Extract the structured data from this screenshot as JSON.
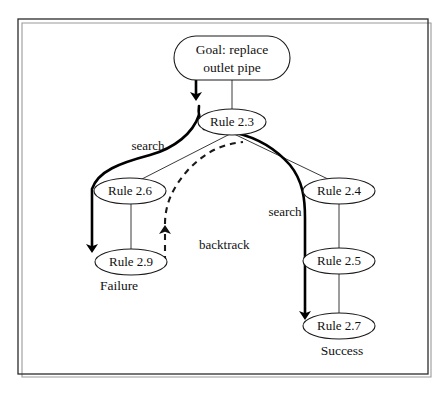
{
  "diagram": {
    "frame": {
      "x": 18,
      "y": 19,
      "width": 410,
      "height": 355
    },
    "nodes": [
      {
        "id": "goal",
        "shape": "stadium",
        "label_line1": "Goal: replace",
        "label_line2": "outlet pipe",
        "cx": 232,
        "cy": 58,
        "rx": 58,
        "ry": 22
      },
      {
        "id": "rule23",
        "shape": "ellipse",
        "label": "Rule 2.3",
        "cx": 232,
        "cy": 122,
        "rx": 34,
        "ry": 13
      },
      {
        "id": "rule26",
        "shape": "ellipse",
        "label": "Rule 2.6",
        "cx": 130,
        "cy": 191,
        "rx": 36,
        "ry": 13
      },
      {
        "id": "rule29",
        "shape": "ellipse",
        "label": "Rule 2.9",
        "cx": 131,
        "cy": 262,
        "rx": 36,
        "ry": 13
      },
      {
        "id": "rule24",
        "shape": "ellipse",
        "label": "Rule 2.4",
        "cx": 339,
        "cy": 191,
        "rx": 36,
        "ry": 13
      },
      {
        "id": "rule25",
        "shape": "ellipse",
        "label": "Rule 2.5",
        "cx": 339,
        "cy": 261,
        "rx": 36,
        "ry": 13
      },
      {
        "id": "rule27",
        "shape": "ellipse",
        "label": "Rule 2.7",
        "cx": 339,
        "cy": 326,
        "rx": 36,
        "ry": 13
      }
    ],
    "edge_labels": [
      {
        "id": "search-left",
        "text": "search",
        "x": 148,
        "y": 150
      },
      {
        "id": "search-right",
        "text": "search",
        "x": 285,
        "y": 216
      },
      {
        "id": "backtrack",
        "text": "backtrack",
        "x": 199,
        "y": 249
      }
    ],
    "outcome_labels": [
      {
        "id": "failure",
        "text": "Failure",
        "x": 119,
        "y": 290
      },
      {
        "id": "success",
        "text": "Success",
        "x": 342,
        "y": 355
      }
    ],
    "colors": {
      "stroke": "#1a1a1a",
      "thin_stroke": "#3a3a3a",
      "background": "#ffffff",
      "frame": "#2b2b2b"
    }
  }
}
